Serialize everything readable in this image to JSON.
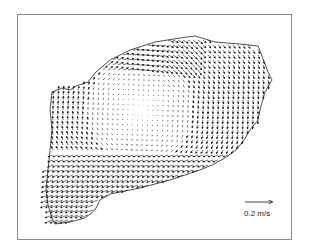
{
  "figure": {
    "type": "velocity-vector-field",
    "scale_arrow": {
      "label": "0.2 m/s",
      "value": 0.2,
      "unit": "m/s"
    },
    "colors": {
      "frame": "#8a8a8a",
      "vectors": "#1a1a1a",
      "background": "#ffffff"
    }
  }
}
